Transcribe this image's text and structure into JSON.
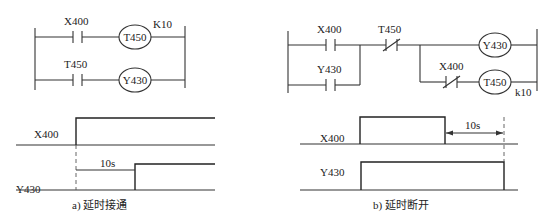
{
  "diagram_a": {
    "ladder": {
      "rung1": {
        "contact_label": "X400",
        "contact_type": "normally-open",
        "coil_label": "T450",
        "preset_label": "K10"
      },
      "rung2": {
        "contact_label": "T450",
        "contact_type": "normally-open",
        "coil_label": "Y430"
      }
    },
    "timing": {
      "signal1_label": "X400",
      "signal2_label": "Y430",
      "delay_label": "10s"
    },
    "caption": "a) 延时接通"
  },
  "diagram_b": {
    "ladder": {
      "branch_contact1_label": "X400",
      "branch_contact2_label": "Y430",
      "series_nc_contact_label": "T450",
      "output_coil_label": "Y430",
      "nc_contact_label": "X400",
      "timer_coil_label": "T450",
      "preset_label": "k10"
    },
    "timing": {
      "signal1_label": "X400",
      "signal2_label": "Y430",
      "delay_label": "10s"
    },
    "caption": "b) 延时断开"
  }
}
